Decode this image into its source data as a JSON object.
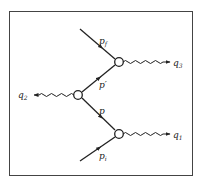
{
  "diagram": {
    "type": "feynman-diagram",
    "colors": {
      "line": "#222222",
      "frame": "#444444",
      "background": "#ffffff"
    },
    "vertices": [
      {
        "id": "v_top",
        "x": 119,
        "y": 62
      },
      {
        "id": "v_left",
        "x": 78,
        "y": 95
      },
      {
        "id": "v_bottom",
        "x": 119,
        "y": 134
      }
    ],
    "fermion_lines": [
      {
        "id": "pf",
        "label": "p",
        "sub": "f",
        "from": "external-top",
        "to": "v_top"
      },
      {
        "id": "pprime",
        "label": "p′",
        "sub": "",
        "from": "v_left",
        "to": "v_top"
      },
      {
        "id": "p",
        "label": "p",
        "sub": "",
        "from": "v_left",
        "to": "v_bottom"
      },
      {
        "id": "pi",
        "label": "p",
        "sub": "i",
        "from": "external-bottom",
        "to": "v_bottom"
      }
    ],
    "photon_lines": [
      {
        "id": "q3",
        "label": "q",
        "sub": "3",
        "from": "v_top",
        "direction": "right"
      },
      {
        "id": "q2",
        "label": "q",
        "sub": "2",
        "from": "v_left",
        "direction": "left"
      },
      {
        "id": "q1",
        "label": "q",
        "sub": "1",
        "from": "v_bottom",
        "direction": "right"
      }
    ]
  },
  "labels": {
    "pf": {
      "main": "p",
      "sub": "f"
    },
    "pprime": {
      "main": "p′"
    },
    "p": {
      "main": "p"
    },
    "pi": {
      "main": "p",
      "sub": "i"
    },
    "q1": {
      "main": "q",
      "sub": "1"
    },
    "q2": {
      "main": "q",
      "sub": "2"
    },
    "q3": {
      "main": "q",
      "sub": "3"
    }
  }
}
